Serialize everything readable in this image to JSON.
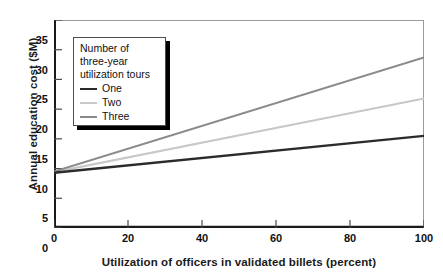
{
  "chart_data": {
    "type": "line",
    "title": "",
    "xlabel": "Utilization of officers in validated billets (percent)",
    "ylabel": "Annual education cost ($M)",
    "xlim": [
      0,
      100
    ],
    "ylim": [
      0,
      35
    ],
    "xticks": [
      0,
      20,
      40,
      60,
      80,
      100
    ],
    "yticks": [
      0,
      5,
      10,
      15,
      20,
      25,
      30,
      35
    ],
    "xtick_labels": [
      "0",
      "20",
      "40",
      "60",
      "80",
      "100"
    ],
    "ytick_labels": [
      "0",
      "5",
      "10",
      "15",
      "20",
      "25",
      "30",
      "35"
    ],
    "grid": false,
    "legend_position": "upper-left-inside",
    "legend_title": "Number of three-year utilization tours",
    "legend_title_lines": [
      "Number of",
      "three-year",
      "utilization tours"
    ],
    "x": [
      0,
      100
    ],
    "series": [
      {
        "name": "One",
        "values": [
          9.3,
          15.5
        ],
        "color": "#2b2b2b",
        "width": 2.4
      },
      {
        "name": "Two",
        "values": [
          9.4,
          21.8
        ],
        "color": "#c8c8c8",
        "width": 2.1
      },
      {
        "name": "Three",
        "values": [
          9.5,
          28.7
        ],
        "color": "#8a8a8a",
        "width": 2.1
      }
    ]
  },
  "axes": {
    "frame_color": "#1a1a1a",
    "background": "#ffffff"
  }
}
